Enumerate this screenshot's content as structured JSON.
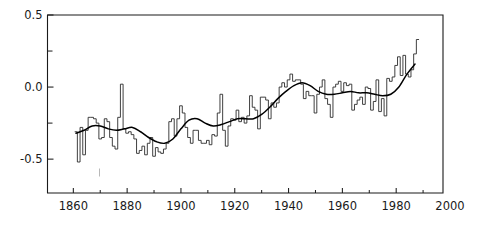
{
  "chart_data": {
    "type": "line",
    "title": "",
    "subtitle": "",
    "xlabel": "",
    "ylabel": "",
    "xlim": [
      1850.4,
      1997.4
    ],
    "ylim": [
      -0.735,
      0.5
    ],
    "grid": false,
    "legend": null,
    "annotations": [],
    "xticks": [
      1860,
      1880,
      1900,
      1920,
      1940,
      1960,
      1980,
      2000
    ],
    "xtick_labels": [
      "1860",
      "1880",
      "1900",
      "1920",
      "1940",
      "1960",
      "1980",
      "2000"
    ],
    "xticks_minor": [
      1850,
      1870,
      1890,
      1910,
      1930,
      1950,
      1970,
      1990
    ],
    "yticks": [
      0.5,
      0.0,
      -0.5
    ],
    "ytick_labels": [
      "0.5",
      "0.0",
      "-0.5"
    ],
    "yticks_minor": [
      0.25,
      -0.25
    ],
    "series": [
      {
        "name": "annual-anomaly",
        "style": "step",
        "x": [
          1861,
          1862,
          1863,
          1864,
          1865,
          1866,
          1867,
          1868,
          1869,
          1870,
          1871,
          1872,
          1873,
          1874,
          1875,
          1876,
          1877,
          1878,
          1879,
          1880,
          1881,
          1882,
          1883,
          1884,
          1885,
          1886,
          1887,
          1888,
          1889,
          1890,
          1891,
          1892,
          1893,
          1894,
          1895,
          1896,
          1897,
          1898,
          1899,
          1900,
          1901,
          1902,
          1903,
          1904,
          1905,
          1906,
          1907,
          1908,
          1909,
          1910,
          1911,
          1912,
          1913,
          1914,
          1915,
          1916,
          1917,
          1918,
          1919,
          1920,
          1921,
          1922,
          1923,
          1924,
          1925,
          1926,
          1927,
          1928,
          1929,
          1930,
          1931,
          1932,
          1933,
          1934,
          1935,
          1936,
          1937,
          1938,
          1939,
          1940,
          1941,
          1942,
          1943,
          1944,
          1945,
          1946,
          1947,
          1948,
          1949,
          1950,
          1951,
          1952,
          1953,
          1954,
          1955,
          1956,
          1957,
          1958,
          1959,
          1960,
          1961,
          1962,
          1963,
          1964,
          1965,
          1966,
          1967,
          1968,
          1969,
          1970,
          1971,
          1972,
          1973,
          1974,
          1975,
          1976,
          1977,
          1978,
          1979,
          1980,
          1981,
          1982,
          1983,
          1984,
          1985,
          1986,
          1987,
          1988
        ],
        "values": [
          -0.31,
          -0.52,
          -0.28,
          -0.47,
          -0.3,
          -0.21,
          -0.21,
          -0.22,
          -0.25,
          -0.36,
          -0.35,
          -0.22,
          -0.24,
          -0.35,
          -0.41,
          -0.43,
          -0.21,
          0.02,
          -0.29,
          -0.32,
          -0.31,
          -0.33,
          -0.36,
          -0.46,
          -0.44,
          -0.41,
          -0.47,
          -0.39,
          -0.35,
          -0.48,
          -0.42,
          -0.45,
          -0.46,
          -0.43,
          -0.39,
          -0.24,
          -0.22,
          -0.34,
          -0.22,
          -0.13,
          -0.18,
          -0.28,
          -0.35,
          -0.39,
          -0.3,
          -0.3,
          -0.37,
          -0.39,
          -0.39,
          -0.37,
          -0.4,
          -0.33,
          -0.34,
          -0.18,
          -0.05,
          -0.3,
          -0.41,
          -0.27,
          -0.22,
          -0.23,
          -0.16,
          -0.24,
          -0.21,
          -0.25,
          -0.2,
          -0.06,
          -0.14,
          -0.16,
          -0.29,
          -0.07,
          -0.07,
          -0.09,
          -0.22,
          -0.11,
          -0.14,
          -0.11,
          0.0,
          0.03,
          0.0,
          0.05,
          0.09,
          0.04,
          0.05,
          0.05,
          0.02,
          -0.08,
          -0.03,
          -0.06,
          -0.06,
          -0.18,
          -0.05,
          0.0,
          0.05,
          -0.08,
          -0.12,
          -0.21,
          0.0,
          0.02,
          0.04,
          -0.03,
          0.03,
          0.01,
          0.02,
          -0.16,
          -0.12,
          -0.09,
          -0.07,
          -0.12,
          0.0,
          -0.01,
          -0.16,
          -0.1,
          0.05,
          -0.17,
          -0.08,
          -0.2,
          0.06,
          0.04,
          0.07,
          0.15,
          0.21,
          0.08,
          0.22,
          0.09,
          0.07,
          0.12,
          0.23,
          0.33
        ]
      },
      {
        "name": "smoothed-trend",
        "style": "smooth",
        "x": [
          1861,
          1864,
          1867,
          1870,
          1873,
          1876,
          1879,
          1882,
          1885,
          1888,
          1891,
          1894,
          1897,
          1900,
          1903,
          1906,
          1909,
          1912,
          1915,
          1918,
          1921,
          1924,
          1927,
          1930,
          1933,
          1936,
          1939,
          1942,
          1945,
          1948,
          1951,
          1954,
          1957,
          1960,
          1963,
          1966,
          1969,
          1972,
          1975,
          1978,
          1981,
          1984,
          1987
        ],
        "values": [
          -0.32,
          -0.3,
          -0.27,
          -0.27,
          -0.29,
          -0.3,
          -0.29,
          -0.28,
          -0.31,
          -0.35,
          -0.38,
          -0.39,
          -0.36,
          -0.29,
          -0.23,
          -0.22,
          -0.25,
          -0.27,
          -0.26,
          -0.24,
          -0.22,
          -0.22,
          -0.22,
          -0.19,
          -0.14,
          -0.08,
          -0.03,
          0.01,
          0.03,
          0.01,
          -0.03,
          -0.05,
          -0.05,
          -0.04,
          -0.03,
          -0.04,
          -0.04,
          -0.05,
          -0.06,
          -0.05,
          0.0,
          0.09,
          0.16
        ]
      }
    ]
  }
}
